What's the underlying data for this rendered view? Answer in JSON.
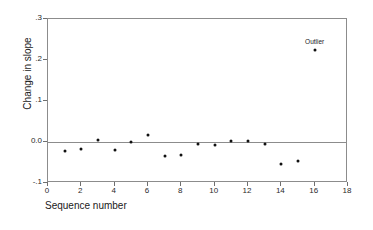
{
  "chart_data": {
    "type": "scatter",
    "title": "",
    "xlabel": "Sequence number",
    "ylabel": "Change in slope",
    "xlim": [
      0,
      18
    ],
    "ylim": [
      -0.1,
      0.3
    ],
    "grid": false,
    "legend": null,
    "x": [
      1,
      2,
      3,
      4,
      5,
      6,
      7,
      8,
      9,
      10,
      11,
      12,
      13,
      14,
      15,
      16
    ],
    "values": [
      -0.022,
      -0.017,
      0.004,
      -0.019,
      -0.001,
      0.016,
      -0.033,
      -0.032,
      -0.006,
      -0.007,
      0.002,
      0.002,
      -0.006,
      -0.053,
      -0.047,
      0.225
    ],
    "xticks": [
      "0",
      "2",
      "4",
      "6",
      "8",
      "10",
      "12",
      "14",
      "16",
      "18"
    ],
    "xtick_values": [
      0,
      2,
      4,
      6,
      8,
      10,
      12,
      14,
      16,
      18
    ],
    "yticks": [
      ".3",
      ".2",
      ".1",
      "0.0",
      "-.1"
    ],
    "ytick_values": [
      0.3,
      0.2,
      0.1,
      0.0,
      -0.1
    ],
    "reference_line": 0.0,
    "annotations": [
      {
        "text": "Outlier",
        "x": 16,
        "y": 0.225
      }
    ],
    "marker_color": "#111111",
    "axis_color": "#8c8c8c"
  }
}
